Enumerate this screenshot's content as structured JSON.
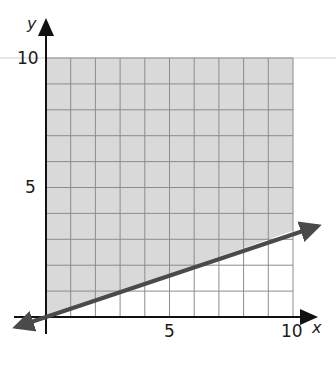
{
  "chart_data": {
    "type": "line",
    "title": "",
    "xlabel": "x",
    "ylabel": "y",
    "xlim": [
      0,
      10
    ],
    "ylim": [
      0,
      10
    ],
    "x_ticks": [
      "5",
      "10"
    ],
    "y_ticks": [
      "5",
      "10"
    ],
    "grid": true,
    "grid_step": 1,
    "series": [
      {
        "name": "boundary line",
        "equation": "y = x/3",
        "x": [
          0,
          10
        ],
        "y": [
          0,
          3.33
        ],
        "style": "solid",
        "arrows": "both"
      }
    ],
    "shaded_region": {
      "description": "region above the line y = x/3 within 0 ≤ x ≤ 10, 0 ≤ y ≤ 10",
      "inequality": "y ≥ x/3"
    },
    "legend": null
  },
  "colors": {
    "shade": "#d9d9d9",
    "grid": "#8c8c8c",
    "line": "#4a4a4a",
    "axis": "#111111",
    "background": "#ffffff"
  },
  "labels": {
    "x_axis": "x",
    "y_axis": "y",
    "x_tick_5": "5",
    "x_tick_10": "10",
    "y_tick_5": "5",
    "y_tick_10": "10"
  }
}
